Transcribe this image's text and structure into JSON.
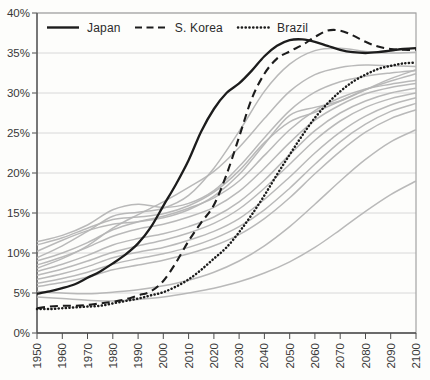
{
  "chart_data": {
    "type": "line",
    "title": "",
    "xlabel": "",
    "ylabel": "",
    "xlim": [
      1950,
      2100
    ],
    "ylim": [
      0,
      40
    ],
    "grid": "horizontal",
    "legend_position": "top-left-inside",
    "x_tick_labels": [
      "1950",
      "1960",
      "1970",
      "1980",
      "1990",
      "2000",
      "2010",
      "2020",
      "2030",
      "2040",
      "2050",
      "2060",
      "2070",
      "2080",
      "2090",
      "2100"
    ],
    "y_tick_labels": [
      "0%",
      "5%",
      "10%",
      "15%",
      "20%",
      "25%",
      "30%",
      "35%",
      "40%"
    ],
    "legend": {
      "entries": [
        {
          "label": "Japan",
          "style": "solid"
        },
        {
          "label": "S. Korea",
          "style": "dashed"
        },
        {
          "label": "Brazil",
          "style": "dotted"
        }
      ]
    },
    "series": [
      {
        "name": "Japan",
        "role": "highlight",
        "style": "solid",
        "color": "#1c1c1c",
        "x_start": 1950,
        "x_step": 5,
        "values": [
          4.9,
          5.2,
          5.6,
          6.1,
          6.9,
          7.7,
          8.7,
          9.8,
          11.2,
          13.2,
          15.9,
          18.6,
          21.6,
          25.2,
          28.0,
          30.0,
          31.2,
          32.8,
          34.6,
          35.9,
          36.6,
          36.7,
          36.4,
          35.9,
          35.4,
          35.1,
          35.0,
          35.1,
          35.3,
          35.5,
          35.6
        ]
      },
      {
        "name": "S. Korea",
        "role": "highlight",
        "style": "dashed",
        "color": "#1c1c1c",
        "x_start": 1950,
        "x_step": 5,
        "values": [
          3.1,
          3.3,
          3.4,
          3.4,
          3.5,
          3.7,
          3.9,
          4.2,
          4.7,
          5.2,
          6.5,
          8.8,
          11.5,
          13.8,
          16.0,
          19.8,
          24.5,
          29.3,
          32.4,
          34.3,
          35.2,
          36.0,
          37.0,
          37.8,
          37.8,
          37.2,
          36.4,
          35.8,
          35.5,
          35.4,
          35.4
        ]
      },
      {
        "name": "Brazil",
        "role": "highlight",
        "style": "dotted",
        "color": "#1c1c1c",
        "x_start": 1950,
        "x_step": 5,
        "values": [
          3.0,
          3.0,
          3.1,
          3.2,
          3.3,
          3.4,
          3.7,
          4.0,
          4.3,
          4.7,
          5.1,
          5.8,
          6.7,
          7.9,
          9.3,
          10.7,
          12.6,
          14.8,
          17.2,
          19.8,
          22.3,
          24.7,
          26.9,
          28.7,
          30.2,
          31.4,
          32.3,
          33.0,
          33.4,
          33.7,
          33.8
        ]
      },
      {
        "name": "other-01",
        "role": "background",
        "style": "solid",
        "color": "#b5b5b5",
        "x_start": 1950,
        "x_step": 10,
        "values": [
          9.4,
          10.9,
          12.7,
          14.6,
          15.1,
          15.6,
          17.2,
          20.6,
          25.2,
          30.2,
          33.6,
          35.3,
          35.6,
          35.2,
          35.0,
          35.1
        ]
      },
      {
        "name": "other-02",
        "role": "background",
        "style": "solid",
        "color": "#b5b5b5",
        "x_start": 1950,
        "x_step": 10,
        "values": [
          8.1,
          9.3,
          10.9,
          13.1,
          14.8,
          16.4,
          18.2,
          20.2,
          23.2,
          26.8,
          30.2,
          32.3,
          33.2,
          33.5,
          33.4,
          33.3
        ]
      },
      {
        "name": "other-03",
        "role": "background",
        "style": "solid",
        "color": "#b5b5b5",
        "x_start": 1950,
        "x_step": 10,
        "values": [
          10.2,
          11.6,
          12.8,
          13.6,
          13.9,
          14.4,
          15.4,
          17.1,
          19.8,
          23.6,
          27.2,
          28.2,
          29.0,
          30.4,
          31.8,
          32.9
        ]
      },
      {
        "name": "other-04",
        "role": "background",
        "style": "solid",
        "color": "#b5b5b5",
        "x_start": 1950,
        "x_step": 10,
        "values": [
          11.0,
          11.9,
          13.1,
          14.2,
          14.5,
          14.9,
          15.9,
          17.6,
          20.3,
          23.8,
          26.4,
          27.6,
          29.0,
          30.4,
          31.5,
          32.4
        ]
      },
      {
        "name": "other-05",
        "role": "background",
        "style": "solid",
        "color": "#b5b5b5",
        "x_start": 1950,
        "x_step": 10,
        "values": [
          11.4,
          12.2,
          13.5,
          15.4,
          16.1,
          15.7,
          16.2,
          17.8,
          20.8,
          24.4,
          27.8,
          30.1,
          31.4,
          32.1,
          32.5,
          32.8
        ]
      },
      {
        "name": "other-06",
        "role": "background",
        "style": "solid",
        "color": "#b5b5b5",
        "x_start": 1950,
        "x_step": 10,
        "values": [
          9.0,
          10.0,
          11.3,
          12.9,
          13.9,
          14.6,
          15.6,
          16.9,
          19.0,
          22.2,
          25.4,
          27.8,
          29.4,
          30.5,
          31.1,
          31.6
        ]
      },
      {
        "name": "other-07",
        "role": "background",
        "style": "solid",
        "color": "#b5b5b5",
        "x_start": 1950,
        "x_step": 10,
        "values": [
          8.5,
          9.5,
          10.7,
          12.1,
          13.0,
          13.6,
          14.5,
          15.7,
          17.7,
          20.6,
          23.8,
          26.6,
          28.5,
          29.9,
          30.7,
          31.2
        ]
      },
      {
        "name": "other-08",
        "role": "background",
        "style": "solid",
        "color": "#b5b5b5",
        "x_start": 1950,
        "x_step": 10,
        "values": [
          7.7,
          8.6,
          9.7,
          11.0,
          11.8,
          12.4,
          13.3,
          14.5,
          16.4,
          19.1,
          22.3,
          25.3,
          27.5,
          29.0,
          30.0,
          30.6
        ]
      },
      {
        "name": "other-09",
        "role": "background",
        "style": "solid",
        "color": "#b5b5b5",
        "x_start": 1950,
        "x_step": 10,
        "values": [
          7.2,
          8.0,
          9.0,
          10.1,
          10.9,
          11.6,
          12.5,
          13.7,
          15.5,
          18.1,
          21.1,
          24.1,
          26.5,
          28.2,
          29.3,
          30.0
        ]
      },
      {
        "name": "other-10",
        "role": "background",
        "style": "solid",
        "color": "#b5b5b5",
        "x_start": 1950,
        "x_step": 10,
        "values": [
          6.7,
          7.4,
          8.3,
          9.4,
          10.1,
          10.7,
          11.6,
          12.7,
          14.3,
          16.7,
          19.5,
          22.5,
          25.1,
          27.1,
          28.5,
          29.4
        ]
      },
      {
        "name": "other-11",
        "role": "background",
        "style": "solid",
        "color": "#b5b5b5",
        "x_start": 1950,
        "x_step": 10,
        "values": [
          6.2,
          6.8,
          7.6,
          8.6,
          9.3,
          9.9,
          10.7,
          11.8,
          13.3,
          15.4,
          18.1,
          21.1,
          23.9,
          26.1,
          27.7,
          28.7
        ]
      },
      {
        "name": "other-12",
        "role": "background",
        "style": "solid",
        "color": "#b5b5b5",
        "x_start": 1950,
        "x_step": 10,
        "values": [
          5.8,
          6.3,
          7.0,
          7.9,
          8.5,
          9.1,
          9.9,
          10.9,
          12.3,
          14.3,
          16.9,
          19.9,
          22.7,
          25.1,
          26.8,
          27.9
        ]
      },
      {
        "name": "other-13",
        "role": "background",
        "style": "solid",
        "color": "#b5b5b5",
        "x_start": 1950,
        "x_step": 10,
        "values": [
          5.2,
          5.0,
          4.9,
          5.1,
          5.4,
          5.9,
          6.6,
          7.6,
          9.0,
          10.9,
          13.3,
          16.1,
          19.0,
          21.7,
          23.9,
          25.4
        ]
      },
      {
        "name": "other-14",
        "role": "background",
        "style": "solid",
        "color": "#b5b5b5",
        "x_start": 1950,
        "x_step": 10,
        "values": [
          4.5,
          4.3,
          4.1,
          4.0,
          4.2,
          4.5,
          5.0,
          5.6,
          6.4,
          7.5,
          8.9,
          10.7,
          12.9,
          15.2,
          17.3,
          19.0
        ]
      }
    ]
  },
  "colors": {
    "highlight": "#1c1c1c",
    "background_series": "#b5b5b5",
    "grid": "#d8d8d8",
    "axis": "#4d4d4d",
    "border": "#a3a3a3",
    "tick_text": "#383838",
    "page_bg": "#fdfdfb"
  }
}
